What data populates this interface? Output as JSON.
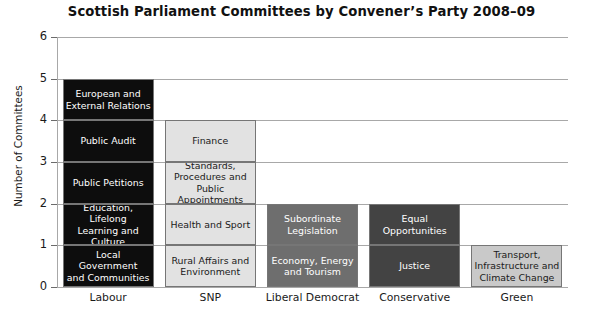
{
  "chart_data": {
    "type": "bar",
    "subtype": "stacked-bar",
    "title": "Scottish Parliament Committees by Convener’s Party 2008–09",
    "xlabel": "",
    "ylabel": "Number of Committees",
    "ylim": [
      0,
      6
    ],
    "yticks": [
      "0",
      "1",
      "2",
      "3",
      "4",
      "5",
      "6"
    ],
    "grid": true,
    "legend": "none",
    "categories": [
      "Labour",
      "SNP",
      "Liberal Democrat",
      "Conservative",
      "Green"
    ],
    "values": [
      5,
      4,
      2,
      2,
      1
    ],
    "series": [
      {
        "name": "Labour",
        "value": 5,
        "color": "#0d0d0d",
        "text_color": "#ffffff",
        "segments": [
          "European and\nExternal Relations",
          "Public Audit",
          "Public Petitions",
          "Education, Lifelong\nLearning and\nCulture",
          "Local Government\nand Communities"
        ]
      },
      {
        "name": "SNP",
        "value": 4,
        "color": "#e2e2e2",
        "text_color": "#1a1a1a",
        "segments": [
          "Finance",
          "Standards,\nProcedures and\nPublic Appointments",
          "Health and Sport",
          "Rural Affairs and\nEnvironment"
        ]
      },
      {
        "name": "Liberal Democrat",
        "value": 2,
        "color": "#6e6e6e",
        "text_color": "#ffffff",
        "segments": [
          "Subordinate\nLegislation",
          "Economy, Energy\nand Tourism"
        ]
      },
      {
        "name": "Conservative",
        "value": 2,
        "color": "#434343",
        "text_color": "#ffffff",
        "segments": [
          "Equal Opportunities",
          "Justice"
        ]
      },
      {
        "name": "Green",
        "value": 1,
        "color": "#c9c9c9",
        "text_color": "#1a1a1a",
        "segments": [
          "Transport,\nInfrastructure and\nClimate Change"
        ]
      }
    ]
  }
}
